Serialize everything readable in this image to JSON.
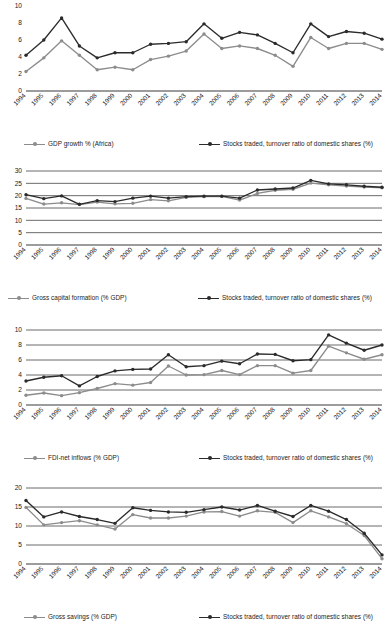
{
  "colors": {
    "series_light": "#8c8c8c",
    "series_dark": "#2b2b2b",
    "gridline": "#3a3a3a",
    "text": "#1a1a1a",
    "background": "#ffffff"
  },
  "categories": [
    "1994",
    "1995",
    "1996",
    "1997",
    "1998",
    "1999",
    "2000",
    "2001",
    "2002",
    "2003",
    "2004",
    "2005",
    "2006",
    "2007",
    "2008",
    "2009",
    "2010",
    "2011",
    "2012",
    "2013",
    "2014"
  ],
  "stocks_series_name": "Stocks traded, turnover ratio of domestic shares (%)",
  "charts": [
    {
      "id": "gdp-growth",
      "ylim": [
        0,
        10
      ],
      "yticks": [
        0,
        2,
        4,
        6,
        8,
        10
      ],
      "ytick_labels": [
        "0",
        "2",
        "4",
        "6",
        "8",
        "10"
      ],
      "grid": false,
      "legend_position": "bottom",
      "series": [
        {
          "name": "GDP growth % (Africa)",
          "color": "#8c8c8c",
          "values": [
            2.3,
            3.9,
            5.9,
            4.2,
            2.5,
            2.8,
            2.5,
            3.7,
            4.1,
            4.7,
            6.7,
            5.0,
            5.3,
            5.0,
            4.2,
            2.9,
            6.3,
            5.0,
            5.6,
            5.6,
            4.9
          ]
        },
        {
          "name": "Stocks traded, turnover ratio of domestic shares (%)",
          "color": "#2b2b2b",
          "values": [
            4.2,
            6.0,
            8.6,
            5.3,
            3.9,
            4.5,
            4.5,
            5.5,
            5.6,
            5.8,
            7.9,
            6.2,
            6.9,
            6.6,
            5.6,
            4.5,
            7.9,
            6.4,
            7.0,
            6.8,
            6.1
          ]
        }
      ]
    },
    {
      "id": "gross-capital-formation",
      "ylim": [
        0,
        30
      ],
      "yticks": [
        0,
        5,
        10,
        15,
        20,
        25,
        30
      ],
      "ytick_labels": [
        "0",
        "5",
        "10",
        "15",
        "20",
        "25",
        "30"
      ],
      "grid": true,
      "legend_position": "bottom",
      "series": [
        {
          "name": "Gross capital formation (% GDP)",
          "color": "#8c8c8c",
          "values": [
            18.9,
            16.6,
            17.1,
            16.4,
            17.4,
            16.7,
            16.9,
            18.4,
            17.9,
            19.3,
            19.6,
            19.7,
            18.2,
            20.9,
            22.2,
            22.6,
            25.1,
            24.4,
            23.9,
            23.5,
            23.2
          ]
        },
        {
          "name": "Stocks traded, turnover ratio of domestic shares (%)",
          "color": "#2b2b2b",
          "values": [
            20.4,
            18.8,
            19.9,
            16.5,
            18.0,
            17.6,
            19.0,
            19.8,
            19.0,
            19.6,
            19.8,
            19.8,
            19.0,
            22.3,
            22.7,
            23.1,
            26.2,
            24.8,
            24.4,
            23.8,
            23.4
          ]
        }
      ]
    },
    {
      "id": "fdi-net-inflows",
      "ylim": [
        0,
        10
      ],
      "yticks": [
        0,
        2,
        4,
        6,
        8,
        10
      ],
      "ytick_labels": [
        "0",
        "2",
        "4",
        "6",
        "8",
        "10"
      ],
      "grid": true,
      "legend_position": "bottom",
      "series": [
        {
          "name": "FDI-net inflows (% GDP)",
          "color": "#8c8c8c",
          "values": [
            1.3,
            1.6,
            1.25,
            1.65,
            2.2,
            2.85,
            2.65,
            3.0,
            5.2,
            4.0,
            4.05,
            4.6,
            4.05,
            5.25,
            5.25,
            4.25,
            4.6,
            7.85,
            6.95,
            6.1,
            6.7
          ]
        },
        {
          "name": "Stocks traded, turnover ratio of domestic shares (%)",
          "color": "#2b2b2b",
          "values": [
            3.2,
            3.7,
            3.9,
            2.55,
            3.8,
            4.55,
            4.75,
            4.8,
            6.7,
            5.1,
            5.25,
            5.85,
            5.5,
            6.8,
            6.75,
            5.9,
            6.05,
            9.35,
            8.25,
            7.3,
            8.0
          ]
        }
      ]
    },
    {
      "id": "gross-savings",
      "ylim": [
        0,
        20
      ],
      "yticks": [
        0,
        5,
        10,
        15,
        20
      ],
      "ytick_labels": [
        "0",
        "5",
        "10",
        "15",
        "20"
      ],
      "grid": true,
      "legend_position": "bottom",
      "series": [
        {
          "name": "Gross savings (% GDP)",
          "color": "#8c8c8c",
          "values": [
            14.9,
            10.3,
            10.9,
            11.4,
            10.3,
            9.2,
            13.0,
            12.1,
            12.1,
            12.6,
            13.7,
            13.8,
            12.6,
            14.0,
            13.6,
            10.9,
            14.0,
            12.4,
            10.6,
            7.5,
            1.4
          ]
        },
        {
          "name": "Stocks traded, turnover ratio of domestic shares (%)",
          "color": "#2b2b2b",
          "values": [
            16.7,
            12.4,
            13.7,
            12.5,
            11.7,
            10.7,
            14.8,
            14.1,
            13.7,
            13.6,
            14.3,
            15.0,
            14.2,
            15.4,
            13.9,
            12.5,
            15.4,
            13.9,
            11.7,
            8.1,
            2.4
          ]
        }
      ]
    }
  ],
  "chart_data": {
    "type": "line",
    "title": "",
    "xlabel": "",
    "ylabel": "",
    "x": [
      "1994",
      "1995",
      "1996",
      "1997",
      "1998",
      "1999",
      "2000",
      "2001",
      "2002",
      "2003",
      "2004",
      "2005",
      "2006",
      "2007",
      "2008",
      "2009",
      "2010",
      "2011",
      "2012",
      "2013",
      "2014"
    ],
    "panels": [
      {
        "ylim": [
          0,
          10
        ],
        "yticks": [
          0,
          2,
          4,
          6,
          8,
          10
        ],
        "legend": [
          "GDP growth % (Africa)",
          "Stocks traded, turnover ratio of domestic shares (%)"
        ],
        "series": [
          {
            "name": "GDP growth % (Africa)",
            "values": [
              2.3,
              3.9,
              5.9,
              4.2,
              2.5,
              2.8,
              2.5,
              3.7,
              4.1,
              4.7,
              6.7,
              5.0,
              5.3,
              5.0,
              4.2,
              2.9,
              6.3,
              5.0,
              5.6,
              5.6,
              4.9
            ]
          },
          {
            "name": "Stocks traded, turnover ratio of domestic shares (%)",
            "values": [
              4.2,
              6.0,
              8.6,
              5.3,
              3.9,
              4.5,
              4.5,
              5.5,
              5.6,
              5.8,
              7.9,
              6.2,
              6.9,
              6.6,
              5.6,
              4.5,
              7.9,
              6.4,
              7.0,
              6.8,
              6.1
            ]
          }
        ]
      },
      {
        "ylim": [
          0,
          30
        ],
        "yticks": [
          0,
          5,
          10,
          15,
          20,
          25,
          30
        ],
        "legend": [
          "Gross capital formation (% GDP)",
          "Stocks traded, turnover ratio of domestic shares (%)"
        ],
        "series": [
          {
            "name": "Gross capital formation (% GDP)",
            "values": [
              18.9,
              16.6,
              17.1,
              16.4,
              17.4,
              16.7,
              16.9,
              18.4,
              17.9,
              19.3,
              19.6,
              19.7,
              18.2,
              20.9,
              22.2,
              22.6,
              25.1,
              24.4,
              23.9,
              23.5,
              23.2
            ]
          },
          {
            "name": "Stocks traded, turnover ratio of domestic shares (%)",
            "values": [
              20.4,
              18.8,
              19.9,
              16.5,
              18.0,
              17.6,
              19.0,
              19.8,
              19.0,
              19.6,
              19.8,
              19.8,
              19.0,
              22.3,
              22.7,
              23.1,
              26.2,
              24.8,
              24.4,
              23.8,
              23.4
            ]
          }
        ]
      },
      {
        "ylim": [
          0,
          10
        ],
        "yticks": [
          0,
          2,
          4,
          6,
          8,
          10
        ],
        "legend": [
          "FDI-net inflows (% GDP)",
          "Stocks traded, turnover ratio of domestic shares (%)"
        ],
        "series": [
          {
            "name": "FDI-net inflows (% GDP)",
            "values": [
              1.3,
              1.6,
              1.25,
              1.65,
              2.2,
              2.85,
              2.65,
              3.0,
              5.2,
              4.0,
              4.05,
              4.6,
              4.05,
              5.25,
              5.25,
              4.25,
              4.6,
              7.85,
              6.95,
              6.1,
              6.7
            ]
          },
          {
            "name": "Stocks traded, turnover ratio of domestic shares (%)",
            "values": [
              3.2,
              3.7,
              3.9,
              2.55,
              3.8,
              4.55,
              4.75,
              4.8,
              6.7,
              5.1,
              5.25,
              5.85,
              5.5,
              6.8,
              6.75,
              5.9,
              6.05,
              9.35,
              8.25,
              7.3,
              8.0
            ]
          }
        ]
      },
      {
        "ylim": [
          0,
          20
        ],
        "yticks": [
          0,
          5,
          10,
          15,
          20
        ],
        "legend": [
          "Gross savings (% GDP)",
          "Stocks traded, turnover ratio of domestic shares (%)"
        ],
        "series": [
          {
            "name": "Gross savings (% GDP)",
            "values": [
              14.9,
              10.3,
              10.9,
              11.4,
              10.3,
              9.2,
              13.0,
              12.1,
              12.1,
              12.6,
              13.7,
              13.8,
              12.6,
              14.0,
              13.6,
              10.9,
              14.0,
              12.4,
              10.6,
              7.5,
              1.4
            ]
          },
          {
            "name": "Stocks traded, turnover ratio of domestic shares (%)",
            "values": [
              16.7,
              12.4,
              13.7,
              12.5,
              11.7,
              10.7,
              14.8,
              14.1,
              13.7,
              13.6,
              14.3,
              15.0,
              14.2,
              15.4,
              13.9,
              12.5,
              15.4,
              13.9,
              11.7,
              8.1,
              2.4
            ]
          }
        ]
      }
    ],
    "grid": true,
    "legend_position": "bottom"
  }
}
